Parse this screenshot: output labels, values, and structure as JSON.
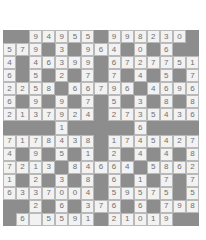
{
  "puzzle": {
    "title": "number-crossword-grid",
    "rows": 15,
    "columns": 15,
    "block_color": "#8d8d8d",
    "open_cell_color": "#f2f2f2",
    "digit_color": "#6f6f6f",
    "grid": [
      [
        "",
        "",
        "9",
        "4",
        "9",
        "5",
        "5",
        "",
        "9",
        "9",
        "8",
        "2",
        "3",
        "0",
        ""
      ],
      [
        "5",
        "7",
        "9",
        "",
        "3",
        "",
        "9",
        "6",
        "4",
        "",
        "0",
        "",
        "6",
        "",
        ""
      ],
      [
        "4",
        "",
        "4",
        "6",
        "3",
        "9",
        "9",
        "",
        "6",
        "7",
        "2",
        "7",
        "7",
        "5",
        "1"
      ],
      [
        "6",
        "",
        "5",
        "",
        "2",
        "",
        "7",
        "",
        "7",
        "",
        "4",
        "",
        "5",
        "",
        "7"
      ],
      [
        "2",
        "2",
        "5",
        "8",
        "",
        "6",
        "6",
        "7",
        "9",
        "6",
        "",
        "4",
        "6",
        "9",
        "6"
      ],
      [
        "6",
        "",
        "9",
        "",
        "9",
        "",
        "7",
        "",
        "5",
        "",
        "3",
        "",
        "8",
        "",
        "8"
      ],
      [
        "2",
        "1",
        "3",
        "7",
        "9",
        "2",
        "4",
        "",
        "2",
        "7",
        "3",
        "5",
        "4",
        "3",
        "6"
      ],
      [
        "",
        "",
        "",
        "",
        "1",
        "",
        "",
        "",
        "",
        "",
        "6",
        "",
        "",
        "",
        ""
      ],
      [
        "7",
        "1",
        "7",
        "8",
        "4",
        "3",
        "8",
        "",
        "1",
        "7",
        "4",
        "5",
        "4",
        "2",
        "7"
      ],
      [
        "4",
        "",
        "9",
        "",
        "5",
        "",
        "1",
        "",
        "2",
        "",
        "4",
        "",
        "4",
        "",
        "8"
      ],
      [
        "7",
        "2",
        "1",
        "3",
        "",
        "8",
        "4",
        "6",
        "6",
        "4",
        "",
        "5",
        "8",
        "6",
        "2"
      ],
      [
        "1",
        "",
        "2",
        "",
        "3",
        "",
        "8",
        "",
        "6",
        "",
        "1",
        "",
        "7",
        "",
        "7"
      ],
      [
        "6",
        "3",
        "3",
        "7",
        "0",
        "0",
        "4",
        "",
        "5",
        "9",
        "5",
        "7",
        "5",
        "",
        "5"
      ],
      [
        "",
        "",
        "2",
        "",
        "6",
        "",
        "3",
        "7",
        "6",
        "",
        "6",
        "",
        "7",
        "9",
        "8"
      ],
      [
        "",
        "6",
        " ",
        "5",
        "5",
        "9",
        "1",
        "",
        "2",
        "1",
        "0",
        "1",
        "9",
        "",
        ""
      ]
    ]
  }
}
